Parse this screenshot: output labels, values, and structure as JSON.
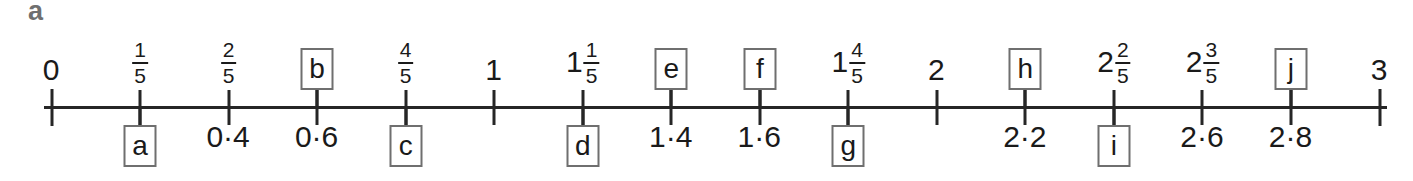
{
  "part": {
    "label": "a"
  },
  "diagram": {
    "type": "number-line",
    "range": [
      0,
      3
    ],
    "tick_interval": 0.2,
    "axis_colour": "#262626",
    "box_border_colour": "#6f6f6f",
    "decimal_separator": "·",
    "ticks": [
      {
        "value": 0,
        "above": {
          "kind": "whole",
          "text": "0"
        },
        "below": {
          "kind": "none"
        }
      },
      {
        "value": 0.2,
        "above": {
          "kind": "fraction",
          "numerator": "1",
          "denominator": "5"
        },
        "below": {
          "kind": "letter-box",
          "letter": "a"
        }
      },
      {
        "value": 0.4,
        "above": {
          "kind": "fraction",
          "numerator": "2",
          "denominator": "5"
        },
        "below": {
          "kind": "decimal",
          "text": "0·4"
        }
      },
      {
        "value": 0.6,
        "above": {
          "kind": "letter-box",
          "letter": "b"
        },
        "below": {
          "kind": "decimal",
          "text": "0·6"
        }
      },
      {
        "value": 0.8,
        "above": {
          "kind": "fraction",
          "numerator": "4",
          "denominator": "5"
        },
        "below": {
          "kind": "letter-box",
          "letter": "c"
        }
      },
      {
        "value": 1,
        "above": {
          "kind": "whole",
          "text": "1"
        },
        "below": {
          "kind": "none"
        }
      },
      {
        "value": 1.2,
        "above": {
          "kind": "mixed",
          "whole": "1",
          "numerator": "1",
          "denominator": "5"
        },
        "below": {
          "kind": "letter-box",
          "letter": "d"
        }
      },
      {
        "value": 1.4,
        "above": {
          "kind": "letter-box",
          "letter": "e"
        },
        "below": {
          "kind": "decimal",
          "text": "1·4"
        }
      },
      {
        "value": 1.6,
        "above": {
          "kind": "letter-box",
          "letter": "f"
        },
        "below": {
          "kind": "decimal",
          "text": "1·6"
        }
      },
      {
        "value": 1.8,
        "above": {
          "kind": "mixed",
          "whole": "1",
          "numerator": "4",
          "denominator": "5"
        },
        "below": {
          "kind": "letter-box",
          "letter": "g"
        }
      },
      {
        "value": 2,
        "above": {
          "kind": "whole",
          "text": "2"
        },
        "below": {
          "kind": "none"
        }
      },
      {
        "value": 2.2,
        "above": {
          "kind": "letter-box",
          "letter": "h"
        },
        "below": {
          "kind": "decimal",
          "text": "2·2"
        }
      },
      {
        "value": 2.4,
        "above": {
          "kind": "mixed",
          "whole": "2",
          "numerator": "2",
          "denominator": "5"
        },
        "below": {
          "kind": "letter-box",
          "letter": "i"
        }
      },
      {
        "value": 2.6,
        "above": {
          "kind": "mixed",
          "whole": "2",
          "numerator": "3",
          "denominator": "5"
        },
        "below": {
          "kind": "decimal",
          "text": "2·6"
        }
      },
      {
        "value": 2.8,
        "above": {
          "kind": "letter-box",
          "letter": "j"
        },
        "below": {
          "kind": "decimal",
          "text": "2·8"
        }
      },
      {
        "value": 3,
        "above": {
          "kind": "whole",
          "text": "3"
        },
        "below": {
          "kind": "none"
        }
      }
    ]
  }
}
